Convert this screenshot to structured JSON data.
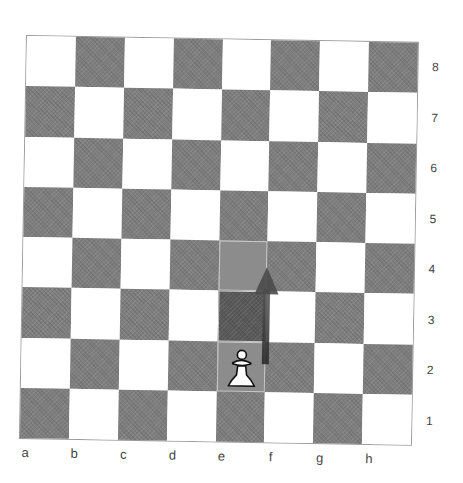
{
  "board": {
    "files": [
      "a",
      "b",
      "c",
      "d",
      "e",
      "f",
      "g",
      "h"
    ],
    "ranks": [
      "8",
      "7",
      "6",
      "5",
      "4",
      "3",
      "2",
      "1"
    ],
    "colors": {
      "light_square": "#ffffff",
      "dark_square": "#7f7f7f",
      "highlight": "#8c8c8c",
      "arrow": "#3a3a3a"
    },
    "pieces": [
      {
        "square": "e2",
        "piece": "white-pawn",
        "glyph": "♙"
      }
    ],
    "highlighted_squares": [
      "e2",
      "e3",
      "e4"
    ],
    "move_arrow": {
      "from": "e2",
      "to": "e4"
    }
  }
}
